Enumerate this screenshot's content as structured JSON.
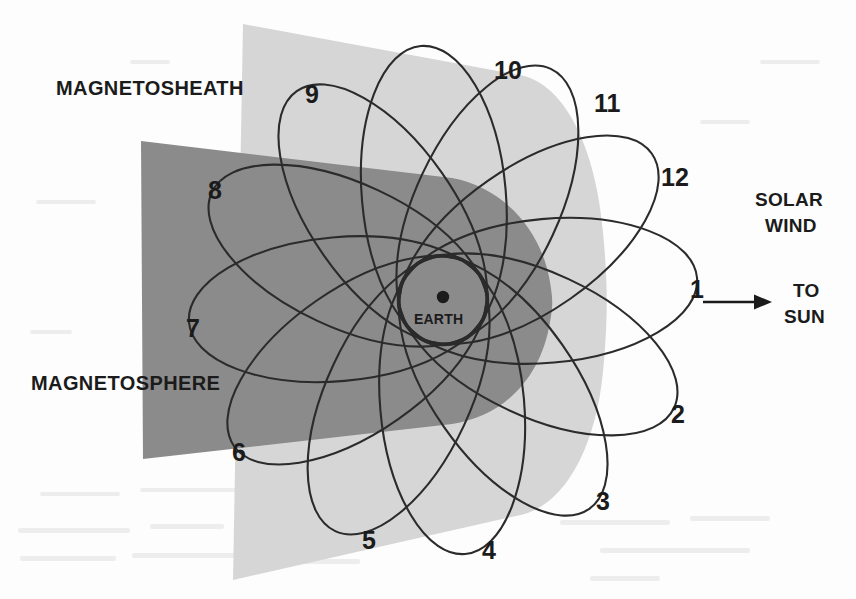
{
  "figure": {
    "title_regions": {
      "magnetosheath": "MAGNETOSHEATH",
      "magnetosphere": "MAGNETOSPHERE"
    },
    "earth_label": "EARTH",
    "solar_wind_label_line1": "SOLAR",
    "solar_wind_label_line2": "WIND",
    "to_sun_label_line1": "TO",
    "to_sun_label_line2": "SUN",
    "arrow_direction": "right",
    "colors": {
      "magnetosheath_fill": "#d6d6d6",
      "magnetosphere_fill": "#8b8b8b",
      "orbit_stroke": "#2b2b2b",
      "text": "#1b1b1b",
      "page_background": "#fdfdfd"
    }
  },
  "chart_data": {
    "type": "diagram",
    "earth": {
      "cx": 443,
      "cy": 300,
      "body_radius": 6,
      "boundary_circle_radius": 45
    },
    "orbits": {
      "count": 12,
      "semi_major_axis": 150,
      "semi_minor_axis": 72,
      "perigee_offset": 105,
      "angle_step_deg": 30,
      "angle_start_deg": -5,
      "note": "Twelve eccentric orbits sharing a common perigee near Earth, each rotated 30 degrees"
    },
    "orbit_labels": [
      {
        "id": "1",
        "x": 690,
        "y": 277
      },
      {
        "id": "2",
        "x": 671,
        "y": 402
      },
      {
        "id": "3",
        "x": 596,
        "y": 489
      },
      {
        "id": "4",
        "x": 482,
        "y": 538
      },
      {
        "id": "5",
        "x": 362,
        "y": 528
      },
      {
        "id": "6",
        "x": 232,
        "y": 440
      },
      {
        "id": "7",
        "x": 186,
        "y": 316
      },
      {
        "id": "8",
        "x": 208,
        "y": 178
      },
      {
        "id": "9",
        "x": 305,
        "y": 82
      },
      {
        "id": "10",
        "x": 494,
        "y": 58
      },
      {
        "id": "11",
        "x": 594,
        "y": 91
      },
      {
        "id": "12",
        "x": 661,
        "y": 165
      }
    ],
    "region_labels": [
      {
        "id": "magnetosheath",
        "x": 56,
        "y": 88
      },
      {
        "id": "magnetosphere",
        "x": 31,
        "y": 383
      }
    ],
    "annotations": [
      {
        "id": "solar-wind",
        "x": 779,
        "y": 198
      },
      {
        "id": "to-sun",
        "x": 805,
        "y": 288
      },
      {
        "id": "arrow",
        "x1": 703,
        "y1": 302,
        "x2": 760,
        "y2": 302
      }
    ],
    "magnetosheath_plane": {
      "top_left": [
        243,
        24
      ],
      "top_right": [
        612,
        92
      ],
      "bottom_right": [
        615,
        520
      ],
      "bottom_left": [
        233,
        580
      ],
      "bow_shock_apex_x": 604
    },
    "magnetosphere_plane": {
      "top_left": [
        141,
        141
      ],
      "top_right": [
        540,
        190
      ],
      "bottom_right": [
        545,
        420
      ],
      "bottom_left": [
        143,
        459
      ],
      "magnetopause_apex_x": 558
    }
  }
}
